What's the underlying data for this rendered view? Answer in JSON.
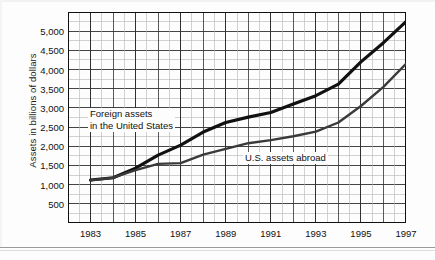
{
  "chart_data": {
    "type": "line",
    "title": "",
    "subtitle": "",
    "xlabel": "",
    "ylabel": "Assets in billions of dollars",
    "xlim": [
      1982,
      1997
    ],
    "ylim": [
      0,
      5500
    ],
    "grid": true,
    "legend_position": "inline-annotations",
    "y_ticks": [
      "500",
      "1,000",
      "1,500",
      "2,000",
      "2,500",
      "3,000",
      "3,500",
      "4,000",
      "4,500",
      "5,000"
    ],
    "y_tick_values": [
      500,
      1000,
      1500,
      2000,
      2500,
      3000,
      3500,
      4000,
      4500,
      5000
    ],
    "x_ticks": [
      "1983",
      "1985",
      "1987",
      "1989",
      "1991",
      "1993",
      "1995",
      "1997"
    ],
    "x_tick_values": [
      1983,
      1985,
      1987,
      1989,
      1991,
      1993,
      1995,
      1997
    ],
    "x": [
      1983,
      1984,
      1985,
      1986,
      1987,
      1988,
      1989,
      1990,
      1991,
      1992,
      1993,
      1994,
      1995,
      1996,
      1997
    ],
    "series": [
      {
        "name": "Foreign assets in the United States",
        "color": "#111111",
        "width": 3.2,
        "values": [
          1120,
          1180,
          1430,
          1770,
          2030,
          2370,
          2620,
          2760,
          2880,
          3100,
          3320,
          3620,
          4200,
          4700,
          5250
        ]
      },
      {
        "name": "U.S. assets abroad",
        "color": "#3a3a3a",
        "width": 2.4,
        "values": [
          1110,
          1180,
          1380,
          1540,
          1560,
          1780,
          1930,
          2080,
          2160,
          2260,
          2380,
          2620,
          3050,
          3550,
          4150
        ]
      }
    ],
    "annotations": [
      {
        "id": "foreign-assets-label",
        "line1": "Foreign assets",
        "line2": "in the United States"
      },
      {
        "id": "us-assets-label",
        "line1": "U.S. assets abroad",
        "line2": ""
      }
    ],
    "colors": {
      "background": "#fdfdfd",
      "grid_major": "#303030",
      "grid_minor": "#b4b4b4",
      "axis": "#111111",
      "text": "#111111"
    }
  }
}
